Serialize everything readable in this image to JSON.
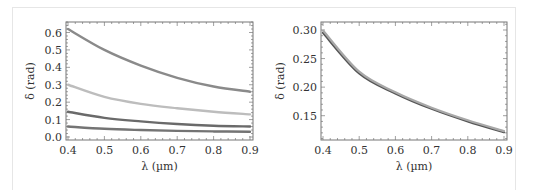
{
  "chart_data": [
    {
      "type": "line",
      "title": "",
      "xlabel": "λ (µm)",
      "ylabel": "δ (rad)",
      "xlim": [
        0.39,
        0.905
      ],
      "ylim": [
        -0.018,
        0.66
      ],
      "xticks": [
        0.4,
        0.5,
        0.6,
        0.7,
        0.8,
        0.9
      ],
      "yticks": [
        0.0,
        0.1,
        0.2,
        0.3,
        0.4,
        0.5,
        0.6
      ],
      "xtick_labels": [
        "0.4",
        "0.5",
        "0.6",
        "0.7",
        "0.8",
        "0.9"
      ],
      "ytick_labels": [
        "0.0",
        "0.1",
        "0.2",
        "0.3",
        "0.4",
        "0.5",
        "0.6"
      ],
      "grid": false,
      "legend": null,
      "x": [
        0.4,
        0.5,
        0.6,
        0.7,
        0.8,
        0.9
      ],
      "series": [
        {
          "name": "curve-1",
          "color": "#8a8a8a",
          "values": [
            0.62,
            0.5,
            0.41,
            0.34,
            0.29,
            0.26
          ]
        },
        {
          "name": "curve-2",
          "color": "#bdbdbd",
          "values": [
            0.3,
            0.23,
            0.19,
            0.165,
            0.145,
            0.13
          ]
        },
        {
          "name": "curve-3",
          "color": "#6a6a6a",
          "values": [
            0.145,
            0.11,
            0.09,
            0.075,
            0.065,
            0.06
          ]
        },
        {
          "name": "curve-4",
          "color": "#747474",
          "values": [
            0.06,
            0.047,
            0.04,
            0.035,
            0.032,
            0.03
          ]
        }
      ]
    },
    {
      "type": "line",
      "title": "",
      "xlabel": "λ (µm)",
      "ylabel": "δ (rad)",
      "xlim": [
        0.39,
        0.905
      ],
      "ylim": [
        0.11,
        0.31
      ],
      "xticks": [
        0.4,
        0.5,
        0.6,
        0.7,
        0.8,
        0.9
      ],
      "yticks": [
        0.15,
        0.2,
        0.25,
        0.3
      ],
      "xtick_labels": [
        "0.4",
        "0.5",
        "0.6",
        "0.7",
        "0.8",
        "0.9"
      ],
      "ytick_labels": [
        "0.15",
        "0.20",
        "0.25",
        "0.30"
      ],
      "grid": false,
      "legend": null,
      "x": [
        0.4,
        0.5,
        0.6,
        0.7,
        0.8,
        0.9
      ],
      "series": [
        {
          "name": "curve-dark",
          "color": "#555555",
          "values": [
            0.295,
            0.224,
            0.189,
            0.162,
            0.14,
            0.121
          ]
        },
        {
          "name": "curve-light",
          "color": "#a8a8a8",
          "values": [
            0.299,
            0.227,
            0.191,
            0.164,
            0.142,
            0.123
          ]
        }
      ]
    }
  ]
}
